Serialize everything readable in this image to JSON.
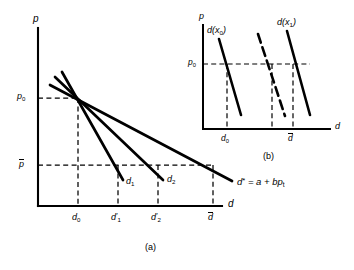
{
  "figure": {
    "caption_a": "(a)",
    "caption_b": "(b)"
  },
  "panel_a": {
    "axis_y_label": "p",
    "axis_x_label": "d",
    "price_ticks": [
      {
        "id": "p0",
        "base": "p",
        "sub": "0",
        "overbar": false
      },
      {
        "id": "pbar",
        "base": "p",
        "sub": "",
        "overbar": true
      }
    ],
    "quantity_ticks": [
      {
        "id": "d0",
        "base": "d",
        "sub": "0",
        "prime": false
      },
      {
        "id": "d1p",
        "base": "d",
        "sub": "1",
        "prime": true
      },
      {
        "id": "d2p",
        "base": "d",
        "sub": "2",
        "prime": true
      },
      {
        "id": "dbar",
        "base": "d",
        "sub": "",
        "overbar": true
      }
    ],
    "curve_labels": [
      {
        "id": "d1",
        "base": "d",
        "sub": "1"
      },
      {
        "id": "d2",
        "base": "d",
        "sub": "2"
      }
    ],
    "equation": {
      "lhs": "d",
      "star": "*",
      "eq": " = a + b",
      "p": "p",
      "sub": "t"
    }
  },
  "panel_b": {
    "axis_y_label": "p",
    "axis_x_label": "d",
    "price_tick": {
      "base": "p",
      "sub": "0"
    },
    "quantity_ticks": [
      {
        "id": "d0",
        "base": "d",
        "sub": "0",
        "overbar": false
      },
      {
        "id": "dbar",
        "base": "d",
        "sub": "",
        "overbar": true
      }
    ],
    "curve_labels": [
      {
        "id": "dx0",
        "base": "d",
        "open": "(",
        "arg": "x",
        "sub": "0",
        "close": ")"
      },
      {
        "id": "dx1",
        "base": "d",
        "open": "(",
        "arg": "x",
        "sub": "1",
        "close": ")"
      }
    ]
  },
  "colors": {
    "ink": "#000000",
    "paper": "#ffffff"
  }
}
